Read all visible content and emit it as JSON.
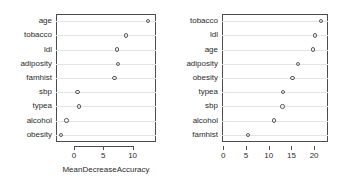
{
  "chart_data": [
    {
      "type": "scatter",
      "title": "",
      "xlabel": "MeanDecreaseAccuracy",
      "ylabel": "",
      "categories": [
        "age",
        "tobacco",
        "ldl",
        "adiposity",
        "famhist",
        "sbp",
        "typea",
        "alcohol",
        "obesity"
      ],
      "values": [
        12.6,
        8.9,
        7.3,
        7.5,
        6.9,
        0.6,
        0.9,
        -1.3,
        -2.2
      ],
      "xticks": [
        0,
        5,
        10
      ],
      "xticklabels": [
        "0",
        "5",
        "10"
      ],
      "xlim": [
        -2.9,
        13.9
      ],
      "grid": "horizontal",
      "legend": "none",
      "marker": "open-circle"
    },
    {
      "type": "scatter",
      "title": "",
      "xlabel": "MeanDecreaseGini",
      "ylabel": "",
      "categories": [
        "tobacco",
        "ldl",
        "age",
        "adiposity",
        "obesity",
        "typea",
        "sbp",
        "alcohol",
        "famhist"
      ],
      "values": [
        21.5,
        20.2,
        19.8,
        16.4,
        15.2,
        13.2,
        13.0,
        11.1,
        5.4
      ],
      "xticks": [
        0,
        5,
        10,
        15,
        20
      ],
      "xticklabels": [
        "0",
        "5",
        "10",
        "15",
        "20"
      ],
      "xlim": [
        -0.2,
        23.1
      ],
      "grid": "horizontal",
      "legend": "none",
      "marker": "open-circle"
    }
  ],
  "panels": [
    {
      "name": "mean-decrease-accuracy",
      "axis_title": "MeanDecreaseAccuracy",
      "tick_labels": [
        "0",
        "5",
        "10"
      ],
      "category_labels": [
        "age",
        "tobacco",
        "ldl",
        "adiposity",
        "famhist",
        "sbp",
        "typea",
        "alcohol",
        "obesity"
      ]
    },
    {
      "name": "mean-decrease-gini",
      "axis_title": "MeanDecreaseGini",
      "tick_labels": [
        "0",
        "5",
        "10",
        "15",
        "20"
      ],
      "category_labels": [
        "tobacco",
        "ldl",
        "age",
        "adiposity",
        "obesity",
        "typea",
        "sbp",
        "alcohol",
        "famhist"
      ]
    }
  ],
  "style": {
    "marker_color": "#5a5a5a",
    "frame_color": "#4d4d4d",
    "grid_color": "#e4e4e4",
    "text_color": "#2b2b2b",
    "background": "#ffffff"
  }
}
